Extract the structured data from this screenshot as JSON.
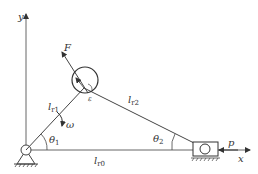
{
  "diagram": {
    "type": "slider-crank mechanism",
    "axes": {
      "x_label": "x",
      "y_label": "y"
    },
    "labels": {
      "force": "F",
      "link1": "l",
      "link1_sub": "r1",
      "link2": "l",
      "link2_sub": "r2",
      "base": "l",
      "base_sub": "r0",
      "omega": "ω",
      "theta1": "θ",
      "theta1_sub": "1",
      "theta2": "θ",
      "theta2_sub": "2",
      "load": "p",
      "epsilon": "ε"
    },
    "colors": {
      "line": "#444444",
      "text": "#333333",
      "background": "#ffffff"
    }
  }
}
